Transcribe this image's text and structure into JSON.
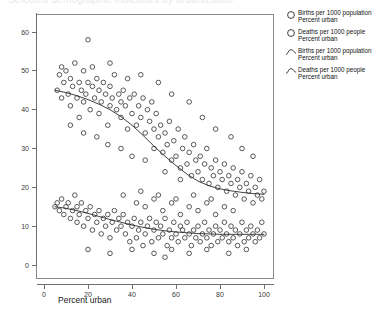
{
  "cut_off_header": "Selected demographic indicators by urbanization",
  "axes": {
    "x": {
      "label": "Percent urban",
      "ticks": [
        0,
        20,
        40,
        60,
        80,
        100
      ],
      "min": 0,
      "max": 100
    },
    "y": {
      "label": "",
      "ticks": [
        0,
        10,
        20,
        30,
        40,
        50,
        60
      ],
      "min": 0,
      "max": 65
    }
  },
  "legend": {
    "position": "right",
    "items": [
      {
        "marker": "open-circle",
        "line1": "Births per 1000 population",
        "line2": "Percent urban"
      },
      {
        "marker": "open-circle",
        "line1": "Deaths per 1000 people",
        "line2": "Percent urban"
      },
      {
        "marker": "fit-curve",
        "line1": "Births per 1000 population",
        "line2": "Percent urban"
      },
      {
        "marker": "fit-curve",
        "line1": "Deaths per 1000 people",
        "line2": "Percent urban"
      }
    ]
  },
  "colors": {
    "point_stroke": "#3b3b3b",
    "fit_line": "#2b2b2b",
    "axis": "#6e6e6e",
    "frame": "#8a8a8a",
    "background": "#ffffff"
  },
  "chart_data": {
    "type": "scatter",
    "title": "",
    "xlabel": "Percent urban",
    "ylabel": "",
    "xlim": [
      0,
      100
    ],
    "ylim": [
      0,
      65
    ],
    "grid": false,
    "legend_position": "right",
    "series": [
      {
        "name": "Births per 1000 population",
        "marker": "open-circle",
        "points": [
          [
            6,
            45
          ],
          [
            7,
            49
          ],
          [
            8,
            51
          ],
          [
            8,
            43
          ],
          [
            9,
            47
          ],
          [
            10,
            50
          ],
          [
            11,
            44
          ],
          [
            12,
            48
          ],
          [
            12,
            41
          ],
          [
            13,
            46
          ],
          [
            14,
            52
          ],
          [
            15,
            43
          ],
          [
            16,
            47
          ],
          [
            16,
            38
          ],
          [
            17,
            45
          ],
          [
            18,
            50
          ],
          [
            18,
            42
          ],
          [
            19,
            44
          ],
          [
            20,
            58
          ],
          [
            20,
            47
          ],
          [
            21,
            40
          ],
          [
            22,
            46
          ],
          [
            22,
            51
          ],
          [
            23,
            43
          ],
          [
            24,
            48
          ],
          [
            25,
            39
          ],
          [
            25,
            45
          ],
          [
            26,
            42
          ],
          [
            27,
            47
          ],
          [
            28,
            44
          ],
          [
            29,
            36
          ],
          [
            30,
            41
          ],
          [
            30,
            46
          ],
          [
            31,
            43
          ],
          [
            32,
            49
          ],
          [
            33,
            40
          ],
          [
            34,
            44
          ],
          [
            35,
            38
          ],
          [
            35,
            42
          ],
          [
            36,
            45
          ],
          [
            37,
            41
          ],
          [
            38,
            35
          ],
          [
            39,
            43
          ],
          [
            40,
            39
          ],
          [
            41,
            44
          ],
          [
            42,
            36
          ],
          [
            43,
            41
          ],
          [
            44,
            38
          ],
          [
            45,
            43
          ],
          [
            46,
            34
          ],
          [
            47,
            40
          ],
          [
            48,
            37
          ],
          [
            49,
            42
          ],
          [
            50,
            30
          ],
          [
            50,
            35
          ],
          [
            51,
            39
          ],
          [
            52,
            33
          ],
          [
            53,
            36
          ],
          [
            54,
            29
          ],
          [
            55,
            34
          ],
          [
            56,
            31
          ],
          [
            57,
            37
          ],
          [
            58,
            27
          ],
          [
            59,
            32
          ],
          [
            60,
            28
          ],
          [
            61,
            35
          ],
          [
            62,
            25
          ],
          [
            63,
            30
          ],
          [
            64,
            33
          ],
          [
            65,
            26
          ],
          [
            66,
            29
          ],
          [
            67,
            23
          ],
          [
            68,
            31
          ],
          [
            69,
            27
          ],
          [
            70,
            24
          ],
          [
            71,
            28
          ],
          [
            72,
            22
          ],
          [
            73,
            26
          ],
          [
            74,
            30
          ],
          [
            75,
            21
          ],
          [
            76,
            25
          ],
          [
            77,
            23
          ],
          [
            78,
            27
          ],
          [
            79,
            20
          ],
          [
            80,
            24
          ],
          [
            81,
            22
          ],
          [
            82,
            26
          ],
          [
            83,
            19
          ],
          [
            84,
            23
          ],
          [
            85,
            21
          ],
          [
            86,
            25
          ],
          [
            87,
            18
          ],
          [
            88,
            22
          ],
          [
            89,
            20
          ],
          [
            90,
            24
          ],
          [
            91,
            17
          ],
          [
            92,
            21
          ],
          [
            93,
            19
          ],
          [
            94,
            23
          ],
          [
            95,
            16
          ],
          [
            96,
            20
          ],
          [
            97,
            18
          ],
          [
            98,
            22
          ],
          [
            99,
            17
          ],
          [
            100,
            19
          ],
          [
            30,
            52
          ],
          [
            38,
            48
          ],
          [
            44,
            49
          ],
          [
            52,
            47
          ],
          [
            58,
            44
          ],
          [
            66,
            42
          ],
          [
            72,
            38
          ],
          [
            78,
            35
          ],
          [
            85,
            33
          ],
          [
            90,
            30
          ],
          [
            95,
            28
          ],
          [
            12,
            36
          ],
          [
            18,
            34
          ],
          [
            24,
            33
          ],
          [
            29,
            31
          ],
          [
            35,
            30
          ],
          [
            40,
            28
          ],
          [
            46,
            27
          ],
          [
            55,
            24
          ],
          [
            62,
            22
          ]
        ]
      },
      {
        "name": "Deaths per 1000 people",
        "marker": "open-circle",
        "points": [
          [
            5,
            15
          ],
          [
            6,
            16
          ],
          [
            7,
            14
          ],
          [
            8,
            17
          ],
          [
            9,
            13
          ],
          [
            10,
            15
          ],
          [
            11,
            16
          ],
          [
            12,
            12
          ],
          [
            13,
            14
          ],
          [
            14,
            18
          ],
          [
            15,
            11
          ],
          [
            15,
            15
          ],
          [
            16,
            13
          ],
          [
            17,
            16
          ],
          [
            18,
            10
          ],
          [
            19,
            14
          ],
          [
            20,
            12
          ],
          [
            21,
            15
          ],
          [
            22,
            9
          ],
          [
            23,
            13
          ],
          [
            24,
            11
          ],
          [
            25,
            14
          ],
          [
            26,
            8
          ],
          [
            27,
            12
          ],
          [
            28,
            10
          ],
          [
            29,
            13
          ],
          [
            30,
            7
          ],
          [
            31,
            11
          ],
          [
            32,
            14
          ],
          [
            33,
            9
          ],
          [
            34,
            12
          ],
          [
            35,
            10
          ],
          [
            36,
            13
          ],
          [
            37,
            8
          ],
          [
            38,
            11
          ],
          [
            39,
            6
          ],
          [
            40,
            10
          ],
          [
            41,
            12
          ],
          [
            42,
            7
          ],
          [
            43,
            9
          ],
          [
            44,
            11
          ],
          [
            45,
            5
          ],
          [
            46,
            8
          ],
          [
            47,
            10
          ],
          [
            48,
            12
          ],
          [
            49,
            6
          ],
          [
            50,
            9
          ],
          [
            51,
            11
          ],
          [
            52,
            7
          ],
          [
            53,
            10
          ],
          [
            54,
            8
          ],
          [
            55,
            12
          ],
          [
            56,
            5
          ],
          [
            57,
            9
          ],
          [
            58,
            7
          ],
          [
            59,
            11
          ],
          [
            60,
            8
          ],
          [
            61,
            6
          ],
          [
            62,
            10
          ],
          [
            63,
            9
          ],
          [
            64,
            7
          ],
          [
            65,
            11
          ],
          [
            66,
            8
          ],
          [
            67,
            5
          ],
          [
            68,
            9
          ],
          [
            69,
            7
          ],
          [
            70,
            10
          ],
          [
            71,
            6
          ],
          [
            72,
            8
          ],
          [
            73,
            11
          ],
          [
            74,
            7
          ],
          [
            75,
            9
          ],
          [
            76,
            5
          ],
          [
            77,
            8
          ],
          [
            78,
            10
          ],
          [
            79,
            6
          ],
          [
            80,
            9
          ],
          [
            81,
            7
          ],
          [
            82,
            11
          ],
          [
            83,
            8
          ],
          [
            84,
            6
          ],
          [
            85,
            10
          ],
          [
            86,
            7
          ],
          [
            87,
            9
          ],
          [
            88,
            5
          ],
          [
            89,
            8
          ],
          [
            90,
            11
          ],
          [
            91,
            6
          ],
          [
            92,
            9
          ],
          [
            93,
            7
          ],
          [
            94,
            10
          ],
          [
            95,
            8
          ],
          [
            96,
            6
          ],
          [
            97,
            9
          ],
          [
            98,
            7
          ],
          [
            99,
            11
          ],
          [
            100,
            8
          ],
          [
            42,
            16
          ],
          [
            46,
            15
          ],
          [
            50,
            17
          ],
          [
            54,
            14
          ],
          [
            58,
            16
          ],
          [
            62,
            13
          ],
          [
            66,
            15
          ],
          [
            70,
            14
          ],
          [
            74,
            16
          ],
          [
            78,
            13
          ],
          [
            82,
            15
          ],
          [
            86,
            14
          ],
          [
            36,
            18
          ],
          [
            44,
            19
          ],
          [
            52,
            18
          ],
          [
            60,
            17
          ],
          [
            68,
            18
          ],
          [
            76,
            17
          ],
          [
            20,
            4
          ],
          [
            30,
            3
          ],
          [
            40,
            4
          ],
          [
            50,
            3
          ],
          [
            58,
            4
          ],
          [
            66,
            3
          ],
          [
            74,
            4
          ],
          [
            84,
            3
          ],
          [
            92,
            4
          ],
          [
            55,
            2
          ]
        ]
      }
    ],
    "fits": [
      {
        "name": "Births per 1000 population",
        "type": "loess",
        "points": [
          [
            5,
            45.0
          ],
          [
            10,
            44.4
          ],
          [
            15,
            43.6
          ],
          [
            20,
            42.6
          ],
          [
            25,
            41.4
          ],
          [
            30,
            40.0
          ],
          [
            35,
            38.2
          ],
          [
            40,
            36.0
          ],
          [
            45,
            33.4
          ],
          [
            50,
            30.6
          ],
          [
            55,
            28.0
          ],
          [
            60,
            25.6
          ],
          [
            65,
            23.4
          ],
          [
            70,
            21.6
          ],
          [
            75,
            20.4
          ],
          [
            80,
            19.6
          ],
          [
            85,
            19.1
          ],
          [
            90,
            18.7
          ],
          [
            95,
            18.4
          ],
          [
            100,
            18.2
          ]
        ]
      },
      {
        "name": "Deaths per 1000 people",
        "type": "loess",
        "points": [
          [
            5,
            15.0
          ],
          [
            10,
            14.6
          ],
          [
            15,
            14.0
          ],
          [
            20,
            13.3
          ],
          [
            25,
            12.5
          ],
          [
            30,
            11.7
          ],
          [
            35,
            11.0
          ],
          [
            40,
            10.3
          ],
          [
            45,
            9.7
          ],
          [
            50,
            9.2
          ],
          [
            55,
            8.8
          ],
          [
            60,
            8.5
          ],
          [
            65,
            8.3
          ],
          [
            70,
            8.1
          ],
          [
            75,
            8.0
          ],
          [
            80,
            7.9
          ],
          [
            85,
            7.9
          ],
          [
            90,
            7.9
          ],
          [
            95,
            7.9
          ],
          [
            100,
            7.9
          ]
        ]
      }
    ]
  }
}
